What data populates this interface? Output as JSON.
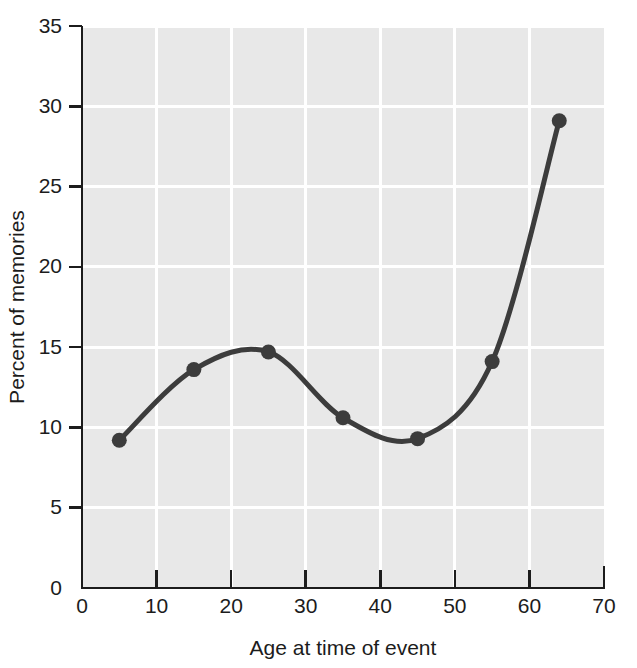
{
  "chart_data": {
    "type": "line",
    "title": "",
    "subtitle": "",
    "xlabel": "Age at time of event",
    "ylabel": "Percent of memories",
    "xlim": [
      0,
      70
    ],
    "ylim": [
      0,
      35
    ],
    "xticks": [
      0,
      10,
      20,
      30,
      40,
      50,
      60,
      70
    ],
    "yticks": [
      0,
      5,
      10,
      15,
      20,
      25,
      30,
      35
    ],
    "xtick_labels": [
      "0",
      "10",
      "20",
      "30",
      "40",
      "50",
      "60",
      "70"
    ],
    "ytick_labels": [
      "0",
      "5",
      "10",
      "15",
      "20",
      "25",
      "30",
      "35"
    ],
    "grid": true,
    "grid_color": "#ffffff",
    "plot_background": "#e8e8e8",
    "series_color": "#3c3c3c",
    "legend": null,
    "legend_position": "none",
    "markers": true,
    "smoothing": "spline",
    "x": [
      5,
      15,
      25,
      35,
      45,
      55,
      64
    ],
    "y": [
      9.2,
      13.6,
      14.7,
      10.6,
      9.3,
      14.1,
      29.1
    ],
    "series": [
      {
        "name": "Percent of memories",
        "color": "#3c3c3c",
        "points": [
          {
            "x": 5,
            "y": 9.2
          },
          {
            "x": 15,
            "y": 13.6
          },
          {
            "x": 25,
            "y": 14.7
          },
          {
            "x": 35,
            "y": 10.6
          },
          {
            "x": 45,
            "y": 9.3
          },
          {
            "x": 55,
            "y": 14.1
          },
          {
            "x": 64,
            "y": 29.1
          }
        ]
      }
    ],
    "annotations": []
  },
  "figure": {
    "axis_color": "#1c1c1c",
    "background": "#ffffff"
  }
}
